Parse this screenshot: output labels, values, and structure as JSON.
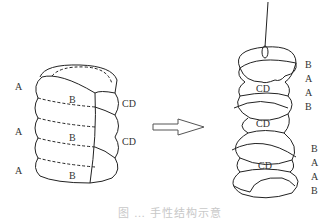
{
  "left_figure": {
    "labels_left": [
      "A",
      "A",
      "A"
    ],
    "labels_inner": [
      "B",
      "B",
      "B"
    ],
    "labels_right": [
      "CD",
      "CD"
    ]
  },
  "arrow": {
    "direction": "right",
    "style": "hollow"
  },
  "right_figure": {
    "labels_cd": [
      "CD",
      "CD",
      "CD"
    ],
    "labels_side_top": [
      "B",
      "A",
      "A",
      "B"
    ],
    "labels_side_bottom": [
      "B",
      "A",
      "A",
      "B"
    ],
    "bottom_side": [
      "A",
      "B"
    ]
  },
  "caption": "图 … 手性结构示意"
}
